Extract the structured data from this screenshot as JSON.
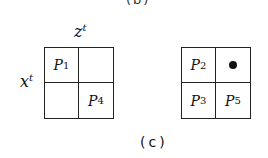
{
  "top_label": "(b)",
  "caption": "(c)",
  "left_grid": {
    "col_axis": {
      "base": "z",
      "sup": "t"
    },
    "row_axis": {
      "base": "x",
      "sup": "t"
    },
    "cells": [
      {
        "base": "P",
        "sub": "1"
      },
      {
        "base": "",
        "sub": ""
      },
      {
        "base": "",
        "sub": ""
      },
      {
        "base": "P",
        "sub": "4"
      }
    ]
  },
  "right_grid": {
    "cells": [
      {
        "base": "P",
        "sub": "2"
      },
      {
        "base": "",
        "sub": "",
        "marker": "dot"
      },
      {
        "base": "P",
        "sub": "3"
      },
      {
        "base": "P",
        "sub": "5"
      }
    ]
  }
}
